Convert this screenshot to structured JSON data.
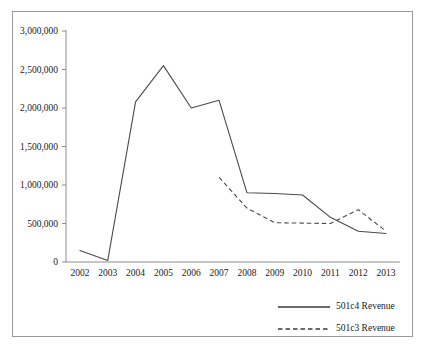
{
  "chart_data": {
    "type": "line",
    "title": "",
    "subtitle": "",
    "xlabel": "",
    "ylabel": "",
    "categories": [
      "2002",
      "2003",
      "2004",
      "2005",
      "2006",
      "2007",
      "2008",
      "2009",
      "2010",
      "2011",
      "2012",
      "2013"
    ],
    "ylim": [
      0,
      3000000
    ],
    "ytick_labels": [
      "0",
      "500,000",
      "1,000,000",
      "1,500,000",
      "2,000,000",
      "2,500,000",
      "3,000,000"
    ],
    "ytick_values": [
      0,
      500000,
      1000000,
      1500000,
      2000000,
      2500000,
      3000000
    ],
    "grid": false,
    "legend_position": "bottom-right",
    "series": [
      {
        "name": "501c4 Revenue",
        "style": "solid",
        "color": "#4a4a4a",
        "x": [
          "2002",
          "2003",
          "2004",
          "2005",
          "2006",
          "2007",
          "2008",
          "2009",
          "2010",
          "2011",
          "2012",
          "2013"
        ],
        "values": [
          150000,
          20000,
          2080000,
          2550000,
          2000000,
          2100000,
          900000,
          890000,
          870000,
          580000,
          400000,
          370000
        ]
      },
      {
        "name": "501c3 Revenue",
        "style": "dashed",
        "color": "#4a4a4a",
        "x": [
          "2007",
          "2008",
          "2009",
          "2010",
          "2011",
          "2012",
          "2013"
        ],
        "values": [
          1100000,
          700000,
          510000,
          505000,
          500000,
          680000,
          400000
        ]
      }
    ]
  },
  "legend": {
    "items": [
      {
        "label": "501c4 Revenue",
        "style": "solid"
      },
      {
        "label": "501c3 Revenue",
        "style": "dashed"
      }
    ]
  }
}
